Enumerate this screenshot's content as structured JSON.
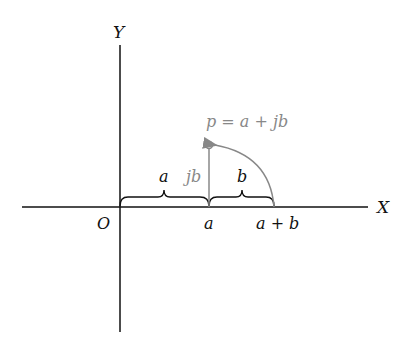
{
  "diagram": {
    "axes": {
      "x_label": "X",
      "y_label": "Y",
      "origin_label": "O"
    },
    "point": {
      "label": "p = a + jb"
    },
    "segments": {
      "a_brace_label": "a",
      "b_brace_label": "b",
      "jb_label": "jb"
    },
    "tick_labels": {
      "a": "a",
      "a_plus_b": "a + b"
    },
    "colors": {
      "axis": "#111111",
      "highlight": "#888888"
    }
  }
}
